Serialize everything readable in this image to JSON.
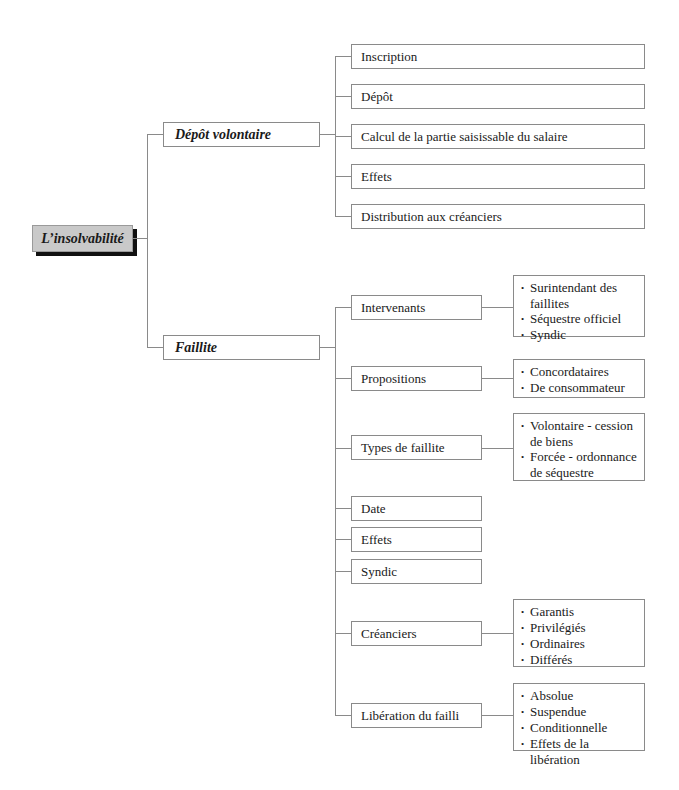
{
  "diagram": {
    "root": {
      "label": "L’insolvabilité"
    },
    "branches": [
      {
        "label": "Dépôt volontaire",
        "children": [
          {
            "label": "Inscription"
          },
          {
            "label": "Dépôt"
          },
          {
            "label": "Calcul de la partie saisissable du salaire"
          },
          {
            "label": "Effets"
          },
          {
            "label": "Distribution aux créanciers"
          }
        ]
      },
      {
        "label": "Faillite",
        "children": [
          {
            "label": "Intervenants",
            "details": [
              "Surintendant des faillites",
              "Séquestre officiel",
              "Syndic"
            ]
          },
          {
            "label": "Propositions",
            "details": [
              "Concordataires",
              "De consommateur"
            ]
          },
          {
            "label": "Types de faillite",
            "details": [
              "Volontaire - cession de biens",
              "Forcée - ordonnance de séquestre"
            ]
          },
          {
            "label": "Date"
          },
          {
            "label": "Effets"
          },
          {
            "label": "Syndic"
          },
          {
            "label": "Créanciers",
            "details": [
              "Garantis",
              "Privilégiés",
              "Ordinaires",
              "Différés"
            ]
          },
          {
            "label": "Libération du failli",
            "details": [
              "Absolue",
              "Suspendue",
              "Conditionnelle",
              "Effets de la libération"
            ]
          }
        ]
      }
    ]
  }
}
